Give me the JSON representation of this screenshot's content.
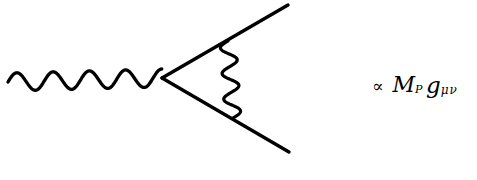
{
  "canvas": {
    "width": 477,
    "height": 180,
    "background_color": "#ffffff",
    "ink_color": "#000000"
  },
  "diagram": {
    "kind": "feynman-diagram",
    "stroke_width": 3.2,
    "vertex": {
      "x": 162,
      "y": 78
    },
    "elements": [
      {
        "name": "incoming-wavy-boson-line",
        "type": "wavy",
        "start": {
          "x": 8,
          "y": 82
        },
        "end": {
          "x": 162,
          "y": 78
        },
        "amplitude": 9,
        "cycles": 4.25
      },
      {
        "name": "upper-fermion-line",
        "type": "straight",
        "start": {
          "x": 162,
          "y": 78
        },
        "end": {
          "x": 288,
          "y": 5
        }
      },
      {
        "name": "lower-fermion-line",
        "type": "straight",
        "start": {
          "x": 162,
          "y": 78
        },
        "end": {
          "x": 289,
          "y": 152
        }
      },
      {
        "name": "internal-wavy-boson-loop-line",
        "type": "wavy",
        "start": {
          "x": 228,
          "y": 41
        },
        "end": {
          "x": 233,
          "y": 118
        },
        "amplitude": 8,
        "cycles": 3.0
      }
    ]
  },
  "formula": {
    "proportional_symbol": "∝",
    "mass_symbol": "M",
    "mass_subscript": "P",
    "metric_symbol": "g",
    "metric_subscript": "μν",
    "plain_text": "∝ M_P g_μν"
  }
}
